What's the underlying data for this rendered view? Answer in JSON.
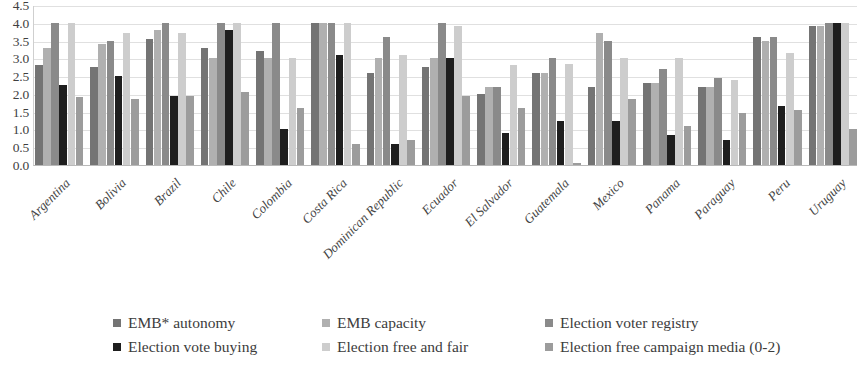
{
  "chart_data": {
    "type": "bar",
    "title": "",
    "subtitle": "",
    "xlabel": "",
    "ylabel": "",
    "ylim": [
      0.0,
      4.5
    ],
    "ytick_labels": [
      "4.5",
      "4.0",
      "3.5",
      "3.0",
      "2.5",
      "2.0",
      "1.5",
      "1.0",
      "0.5",
      "0.0"
    ],
    "ytick_values": [
      4.5,
      4.0,
      3.5,
      3.0,
      2.5,
      2.0,
      1.5,
      1.0,
      0.5,
      0.0
    ],
    "grid": true,
    "legend_position": "bottom",
    "categories": [
      "Argentina",
      "Bolivia",
      "Brazil",
      "Chile",
      "Colombia",
      "Costa Rica",
      "Dominican Republic",
      "Ecuador",
      "El Salvador",
      "Guatemala",
      "Mexico",
      "Panama",
      "Paraguay",
      "Peru",
      "Uruguay"
    ],
    "series": [
      {
        "name": "EMB* autonomy",
        "color": "#747474",
        "values": [
          2.8,
          2.75,
          3.55,
          3.3,
          3.2,
          4.0,
          2.6,
          2.75,
          2.0,
          2.6,
          2.2,
          2.3,
          2.2,
          3.6,
          3.9
        ]
      },
      {
        "name": "EMB capacity",
        "color": "#b0b0b0",
        "values": [
          3.3,
          3.4,
          3.8,
          3.0,
          3.0,
          4.0,
          3.0,
          3.0,
          2.2,
          2.6,
          3.7,
          2.3,
          2.2,
          3.5,
          3.9
        ]
      },
      {
        "name": "Election voter registry",
        "color": "#8a8a8a",
        "values": [
          4.0,
          3.5,
          4.0,
          4.0,
          4.0,
          4.0,
          3.6,
          4.0,
          2.2,
          3.0,
          3.5,
          2.7,
          2.45,
          3.6,
          4.0
        ]
      },
      {
        "name": "Election vote buying",
        "color": "#1e1e1e",
        "values": [
          2.25,
          2.5,
          1.95,
          3.8,
          1.0,
          3.1,
          0.6,
          3.0,
          0.9,
          1.25,
          1.25,
          0.85,
          0.7,
          1.65,
          4.0
        ]
      },
      {
        "name": "Election free and fair",
        "color": "#cdcdcd",
        "values": [
          4.0,
          3.7,
          3.7,
          4.0,
          3.0,
          4.0,
          3.1,
          3.9,
          2.8,
          2.85,
          3.0,
          3.0,
          2.4,
          3.15,
          4.0
        ]
      },
      {
        "name": "Election free campaign media (0-2)",
        "color": "#9c9c9c",
        "values": [
          1.9,
          1.85,
          1.95,
          2.05,
          1.6,
          0.6,
          0.7,
          1.95,
          1.6,
          0.05,
          1.85,
          1.1,
          1.45,
          1.55,
          1.0
        ]
      }
    ]
  },
  "legend": {
    "items": [
      {
        "label": "EMB* autonomy",
        "color": "#747474"
      },
      {
        "label": "EMB capacity",
        "color": "#b0b0b0"
      },
      {
        "label": "Election voter registry",
        "color": "#8a8a8a"
      },
      {
        "label": "Election vote buying",
        "color": "#1e1e1e"
      },
      {
        "label": "Election free and fair",
        "color": "#cdcdcd"
      },
      {
        "label": "Election free campaign media (0-2)",
        "color": "#9c9c9c"
      }
    ]
  }
}
